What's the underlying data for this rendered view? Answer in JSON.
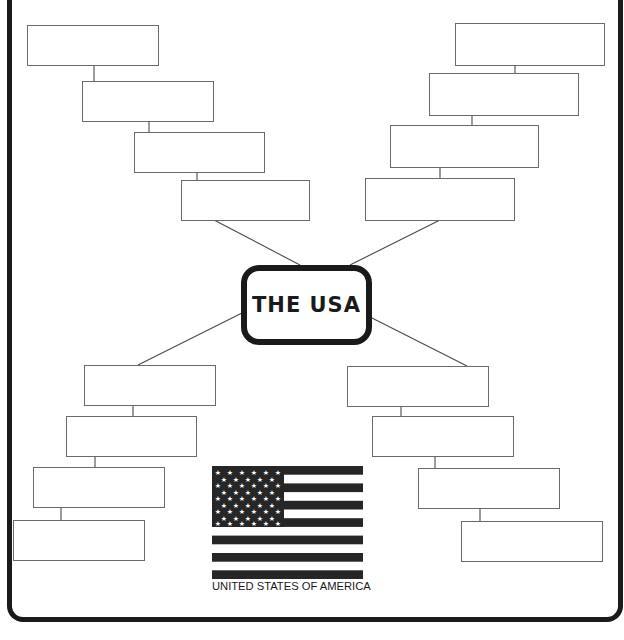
{
  "title": "THE USA",
  "flag_caption": "UNITED STATES OF AMERICA",
  "colors": {
    "ink": "#1a1a1a",
    "box_border": "#6a6a6a",
    "background": "#ffffff"
  },
  "branches": {
    "top_left": [
      "",
      "",
      "",
      ""
    ],
    "top_right": [
      "",
      "",
      "",
      ""
    ],
    "bottom_left": [
      "",
      "",
      "",
      ""
    ],
    "bottom_right": [
      "",
      "",
      "",
      ""
    ]
  },
  "flag": {
    "stars_rows": 9,
    "stripes": 13,
    "icon": "us-flag-icon"
  }
}
